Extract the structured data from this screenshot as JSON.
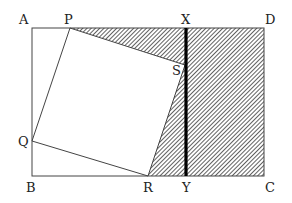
{
  "diagram": {
    "type": "geometry-figure",
    "labels": {
      "A": "A",
      "P": "P",
      "X": "X",
      "D": "D",
      "S": "S",
      "Q": "Q",
      "B": "B",
      "R": "R",
      "Y": "Y",
      "C": "C"
    },
    "points": {
      "A": [
        32,
        28
      ],
      "D": [
        264,
        28
      ],
      "B": [
        32,
        176
      ],
      "C": [
        264,
        176
      ],
      "P": [
        70,
        28
      ],
      "Q": [
        32,
        141
      ],
      "R": [
        148,
        176
      ],
      "S": [
        185,
        65
      ],
      "X": [
        186,
        28
      ],
      "Y": [
        186,
        176
      ]
    },
    "colors": {
      "line": "#333333",
      "hatch": "#444444",
      "thick_line": "#000000"
    }
  }
}
